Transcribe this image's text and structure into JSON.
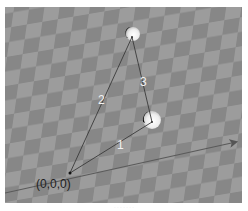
{
  "scene": {
    "ground": {
      "pattern": "checkerboard",
      "light_color": "#9e9e9e",
      "dark_color": "#838383"
    },
    "origin": {
      "label": "(0,0,0)",
      "x": 70,
      "y": 173
    },
    "axis_arrow": {
      "from": [
        0,
        194
      ],
      "to": [
        238,
        142
      ],
      "color": "#555555"
    },
    "spheres": [
      {
        "name": "top-sphere",
        "cx": 131,
        "cy": 33,
        "r": 7
      },
      {
        "name": "lower-sphere",
        "cx": 150,
        "cy": 120,
        "r": 9
      }
    ],
    "segments": [
      {
        "id": 1,
        "label": "1",
        "from": [
          70,
          173
        ],
        "to": [
          152,
          122
        ]
      },
      {
        "id": 2,
        "label": "2",
        "from": [
          70,
          173
        ],
        "to": [
          132,
          37
        ]
      },
      {
        "id": 3,
        "label": "3",
        "from": [
          132,
          37
        ],
        "to": [
          152,
          122
        ]
      }
    ]
  },
  "caption": "· · · · · · ·"
}
